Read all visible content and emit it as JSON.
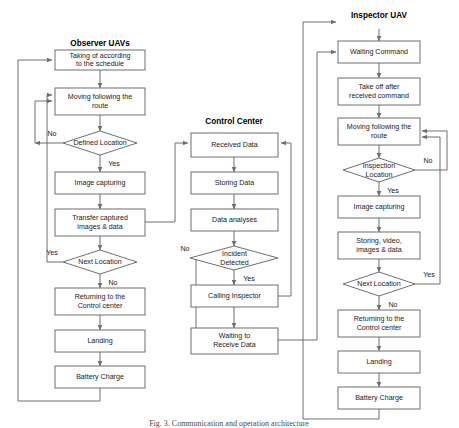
{
  "figure": {
    "caption": "Fig. 3.  Communication and operation architecture",
    "line_color": "#6f6f6f",
    "box_fill": "#ffffff",
    "text_color": "#1a1a1a"
  },
  "columns": [
    {
      "id": "observer",
      "title": "Observer UAVs"
    },
    {
      "id": "control",
      "title": "Control Center"
    },
    {
      "id": "inspector",
      "title": "Inspector UAV"
    }
  ],
  "observer": {
    "title": "Observer UAVs",
    "nodes": [
      {
        "id": "o1",
        "type": "process",
        "lines": [
          "Taking of according",
          "to the schedule"
        ]
      },
      {
        "id": "o2",
        "type": "process",
        "lines": [
          "Moving following the",
          "route"
        ]
      },
      {
        "id": "o3",
        "type": "decision",
        "lines": [
          "Defined Location"
        ]
      },
      {
        "id": "o4",
        "type": "process",
        "lines": [
          "Image capturing"
        ]
      },
      {
        "id": "o5",
        "type": "process",
        "lines": [
          "Transfer captured",
          "images & data"
        ]
      },
      {
        "id": "o6",
        "type": "decision",
        "lines": [
          "Next Location"
        ]
      },
      {
        "id": "o7",
        "type": "process",
        "lines": [
          "Returning to the",
          "Control center"
        ]
      },
      {
        "id": "o8",
        "type": "process",
        "lines": [
          "Landing"
        ]
      },
      {
        "id": "o9",
        "type": "process",
        "lines": [
          "Battery Charge"
        ]
      }
    ],
    "edge_labels": {
      "defined_no": "No",
      "defined_yes": "Yes",
      "next_yes": "Yes",
      "next_no": "No"
    }
  },
  "control": {
    "title": "Control Center",
    "nodes": [
      {
        "id": "c1",
        "type": "process",
        "lines": [
          "Received Data"
        ]
      },
      {
        "id": "c2",
        "type": "process",
        "lines": [
          "Storing Data"
        ]
      },
      {
        "id": "c3",
        "type": "process",
        "lines": [
          "Data analyses"
        ]
      },
      {
        "id": "c4",
        "type": "decision",
        "lines": [
          "Incident",
          "Detected"
        ]
      },
      {
        "id": "c5",
        "type": "process",
        "lines": [
          "Calling Inspector"
        ]
      },
      {
        "id": "c6",
        "type": "process",
        "lines": [
          "Waiting to",
          "Receive Data"
        ]
      }
    ],
    "edge_labels": {
      "incident_no": "No",
      "incident_yes": "Yes"
    }
  },
  "inspector": {
    "title": "Inspector UAV",
    "nodes": [
      {
        "id": "i1",
        "type": "process",
        "lines": [
          "Waiting Command"
        ]
      },
      {
        "id": "i2",
        "type": "process",
        "lines": [
          "Take off after",
          "received command"
        ]
      },
      {
        "id": "i3",
        "type": "process",
        "lines": [
          "Moving following the",
          "route"
        ]
      },
      {
        "id": "i4",
        "type": "decision",
        "lines": [
          "Inspection",
          "Location"
        ]
      },
      {
        "id": "i5",
        "type": "process",
        "lines": [
          "Image capturing"
        ]
      },
      {
        "id": "i6",
        "type": "process",
        "lines": [
          "Storing, video,",
          "images & data"
        ]
      },
      {
        "id": "i7",
        "type": "decision",
        "lines": [
          "Next Location"
        ]
      },
      {
        "id": "i8",
        "type": "process",
        "lines": [
          "Returning to the",
          "Control center"
        ]
      },
      {
        "id": "i9",
        "type": "process",
        "lines": [
          "Landing"
        ]
      },
      {
        "id": "i10",
        "type": "process",
        "lines": [
          "Battery Charge"
        ]
      }
    ],
    "edge_labels": {
      "inspection_no": "No",
      "inspection_yes": "Yes",
      "next_yes": "Yes",
      "next_no": "No"
    }
  }
}
